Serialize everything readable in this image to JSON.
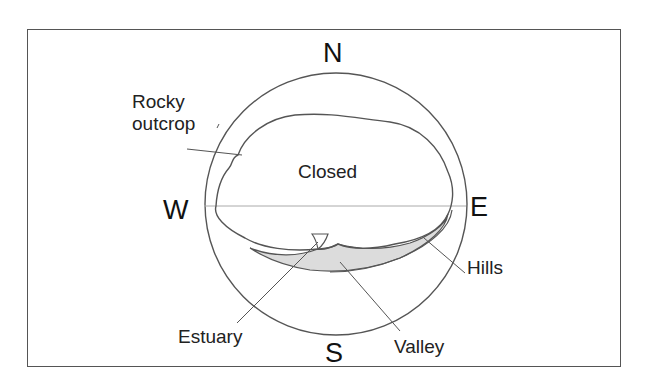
{
  "diagram": {
    "compass": {
      "north": "N",
      "south": "S",
      "east": "E",
      "west": "W"
    },
    "regions": {
      "closed": "Closed"
    },
    "annotations": {
      "rocky_outcrop_line1": "Rocky",
      "rocky_outcrop_line2": "outcrop",
      "hills": "Hills",
      "estuary": "Estuary",
      "valley": "Valley"
    },
    "colors": {
      "line": "#555555",
      "fill_valley": "#dcdcdc",
      "horizon": "#999999",
      "background": "#ffffff"
    }
  }
}
